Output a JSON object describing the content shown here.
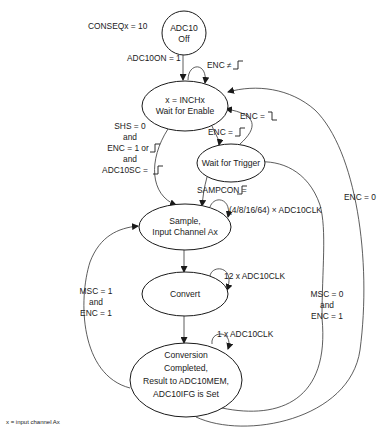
{
  "diagram": {
    "type": "state-machine",
    "states": [
      {
        "id": "off",
        "lines": [
          "ADC10",
          "Off"
        ]
      },
      {
        "id": "wait_enable",
        "lines": [
          "x = INCHx",
          "Wait for Enable"
        ]
      },
      {
        "id": "wait_trigger",
        "lines": [
          "Wait for Trigger"
        ]
      },
      {
        "id": "sample",
        "lines": [
          "Sample,",
          "Input Channel Ax"
        ]
      },
      {
        "id": "convert",
        "lines": [
          "Convert"
        ]
      },
      {
        "id": "complete",
        "lines": [
          "Conversion",
          "Completed,",
          "Result to ADC10MEM,",
          "ADC10IFG is Set"
        ]
      }
    ],
    "labels": {
      "conseq": "CONSEQx = 10",
      "adc10on": "ADC10ON = 1",
      "enc_rise_self": "ENC ≠",
      "enc_fall": "ENC =",
      "enc_rise": "ENC =",
      "shs": [
        "SHS = 0",
        "and",
        "ENC = 1 or",
        "and",
        "ADC10SC ="
      ],
      "sampcon": "SAMPCON =",
      "sample_clk": "(4/8/16/64) × ADC10CLK",
      "convert_clk": "12 x ADC10CLK",
      "complete_clk": "1 x ADC10CLK",
      "msc1": [
        "MSC = 1",
        "and",
        "ENC = 1"
      ],
      "msc0": [
        "MSC = 0",
        "and",
        "ENC = 1"
      ],
      "enc0": "ENC = 0"
    },
    "footnote": "x = input channel Ax"
  }
}
